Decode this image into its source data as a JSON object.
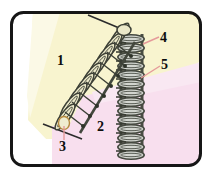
{
  "figure": {
    "kind": "instructional-diagram",
    "frame": {
      "shape": "rounded-rectangle",
      "border_color": "#161616",
      "border_width_px": 3,
      "corner_radius_px": 13,
      "fill_color": "#ffffff",
      "bounds": {
        "x": 10,
        "y": 11,
        "width": 192,
        "height": 156
      }
    },
    "regions": [
      {
        "name": "upper-yellow-region",
        "color": "#f7f3cd",
        "description": "pale yellow wedge occupying upper-left of frame"
      },
      {
        "name": "lower-pink-region",
        "color": "#f7dded",
        "description": "pale pink wedge occupying lower-middle of frame"
      }
    ],
    "yarn": {
      "diagonal_row_color": "#e8e6c8",
      "diagonal_row_outline": "#3d4036",
      "vertical_row_color": "#cfd2cc",
      "vertical_row_outline": "#43473f",
      "needle_color": "#2c2c2c"
    },
    "leader_line_color": "#e59a9a"
  },
  "labels": [
    {
      "id": "1",
      "text": "1",
      "target": "upper-yellow-fabric-area",
      "has_leader": false
    },
    {
      "id": "2",
      "text": "2",
      "target": "lower-pink-fabric-area",
      "has_leader": false
    },
    {
      "id": "3",
      "text": "3",
      "target": "bottom-loop-on-diagonal-row",
      "has_leader": true
    },
    {
      "id": "4",
      "text": "4",
      "target": "top-of-vertical-stitch-row",
      "has_leader": true
    },
    {
      "id": "5",
      "text": "5",
      "target": "middle-of-vertical-stitch-row",
      "has_leader": true
    }
  ]
}
